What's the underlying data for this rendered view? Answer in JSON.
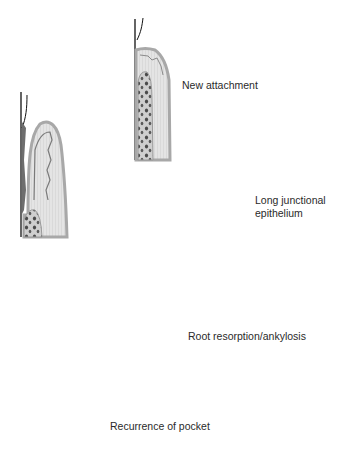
{
  "diagram": {
    "title": "",
    "colors": {
      "tooth_line": "#1a1a1a",
      "gingiva_outer": "#b8b8b8",
      "gingiva_fill": "#e6e6e6",
      "connective_fill": "#d4d4d4",
      "bone_fill": "#cfcfcf",
      "bone_spots": "#555555",
      "pocket_epithelium": "#6e6e6e",
      "arrow": "#111111"
    },
    "panels": [
      {
        "id": "initial",
        "name": "Initial periodontal pocket",
        "x": 22,
        "y": 112
      },
      {
        "id": "new-attachment",
        "name": "New attachment",
        "x": 135,
        "y": 20
      },
      {
        "id": "long-junctional",
        "name": "Long junctional epithelium",
        "x": 205,
        "y": 125
      },
      {
        "id": "root-resorption",
        "name": "Root resorption/ankylosis",
        "x": 135,
        "y": 235
      },
      {
        "id": "recurrence",
        "name": "Recurrence of pocket",
        "x": 52,
        "y": 335
      }
    ],
    "labels": {
      "new_attachment": "New attachment",
      "long_junctional": "Long junctional\nepithelium",
      "root_resorption": "Root resorption/ankylosis",
      "recurrence": "Recurrence of pocket"
    },
    "arrows": [
      {
        "from": "initial",
        "to": "new-attachment"
      },
      {
        "from": "initial",
        "to": "long-junctional"
      },
      {
        "from": "initial",
        "to": "root-resorption"
      },
      {
        "from": "initial",
        "to": "recurrence"
      }
    ]
  }
}
